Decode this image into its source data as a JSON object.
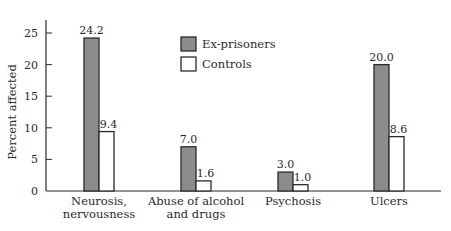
{
  "chart_data": {
    "type": "bar",
    "title": "",
    "xlabel": "Disorder",
    "ylabel": "Percent affected",
    "ylim": [
      0,
      27
    ],
    "yticks": [
      0,
      5,
      10,
      15,
      20,
      25
    ],
    "grid": false,
    "legend_position": "upper-center",
    "categories": [
      [
        "Neurosis,",
        "nervousness"
      ],
      [
        "Abuse of alcohol",
        "and drugs"
      ],
      [
        "Psychosis"
      ],
      [
        "Ulcers"
      ]
    ],
    "series": [
      {
        "name": "Ex-prisoners",
        "color": "#8c8c8c",
        "values": [
          24.2,
          7.0,
          3.0,
          20.0
        ],
        "labels": [
          "24.2",
          "7.0",
          "3.0",
          "20.0"
        ]
      },
      {
        "name": "Controls",
        "color": "#ffffff",
        "values": [
          9.4,
          1.6,
          1.0,
          8.6
        ],
        "labels": [
          "9.4",
          "1.6",
          "1.0",
          "8.6"
        ]
      }
    ]
  },
  "legend": {
    "items": [
      {
        "label": "Ex-prisoners",
        "color": "#8c8c8c"
      },
      {
        "label": "Controls",
        "color": "#ffffff"
      }
    ]
  },
  "axes": {
    "ylabel": "Percent affected",
    "xlabel": "Disorder"
  }
}
